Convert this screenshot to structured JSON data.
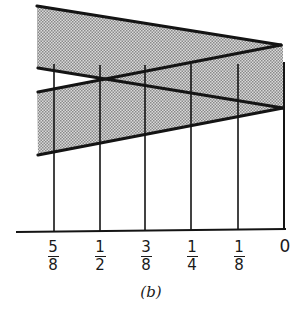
{
  "figure": {
    "caption": "(b)",
    "axis_ticks": [
      {
        "num": "5",
        "den": "8",
        "value": 0.625
      },
      {
        "num": "1",
        "den": "2",
        "value": 0.5
      },
      {
        "num": "3",
        "den": "8",
        "value": 0.375
      },
      {
        "num": "1",
        "den": "4",
        "value": 0.25
      },
      {
        "num": "1",
        "den": "8",
        "value": 0.125
      },
      {
        "num": "0",
        "den": null,
        "value": 0
      }
    ],
    "colors": {
      "ink": "#141414",
      "shade": "#bdbdbd",
      "background": "#ffffff"
    }
  }
}
